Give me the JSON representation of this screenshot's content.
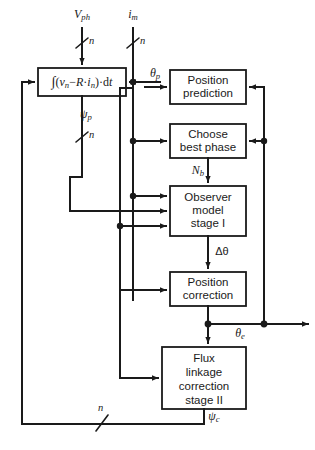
{
  "diagram": {
    "type": "block-diagram",
    "blocks": [
      {
        "id": "integrator",
        "label_text": "∫(vₙ − R·iₙ)·dt",
        "x": 38,
        "y": 68,
        "w": 88,
        "h": 28
      },
      {
        "id": "position-prediction",
        "line1": "Position",
        "line2": "prediction",
        "x": 170,
        "y": 70,
        "w": 76,
        "h": 34
      },
      {
        "id": "choose-best-phase",
        "line1": "Choose",
        "line2": "best phase",
        "x": 170,
        "y": 124,
        "w": 76,
        "h": 34
      },
      {
        "id": "observer-model",
        "line1": "Observer",
        "line2": "model",
        "line3": "stage I",
        "x": 170,
        "y": 186,
        "w": 76,
        "h": 50
      },
      {
        "id": "position-correction",
        "line1": "Position",
        "line2": "correction",
        "x": 170,
        "y": 272,
        "w": 76,
        "h": 34
      },
      {
        "id": "flux-linkage-correction",
        "line1": "Flux",
        "line2": "linkage",
        "line3": "correction",
        "line4": "stage II",
        "x": 162,
        "y": 347,
        "w": 84,
        "h": 62
      }
    ],
    "signals": {
      "v_ph": "V",
      "v_ph_sub": "ph",
      "i_m": "i",
      "i_m_sub": "m",
      "psi_p": "ψ",
      "psi_p_sub": "p",
      "theta_p": "θ",
      "theta_p_sub": "p",
      "theta_e": "θ",
      "theta_e_sub": "e",
      "theta_delta": "Δθ",
      "n_b": "N",
      "n_b_sub": "b",
      "psi_c": "ψ",
      "psi_c_sub": "c",
      "bus_width": "n"
    },
    "bus_markers": [
      {
        "id": "bus-vph",
        "label": "n"
      },
      {
        "id": "bus-im",
        "label": "n"
      },
      {
        "id": "bus-psip",
        "label": "n"
      },
      {
        "id": "bus-psic",
        "label": "n"
      }
    ],
    "colors": {
      "line": "#1a1a1a",
      "box_fill": "#ffffff",
      "background": "#ffffff"
    }
  }
}
